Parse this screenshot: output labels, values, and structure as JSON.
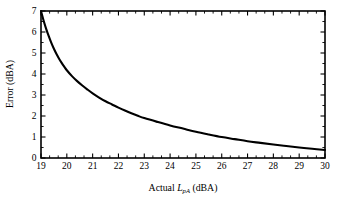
{
  "chart_data": {
    "type": "line",
    "title": "",
    "subtitle": "",
    "xlabel_parts": {
      "lead": "Actual ",
      "symbol": "L",
      "subscript": "pA",
      "trail": " (dBA)"
    },
    "xlabel": "Actual LpA (dBA)",
    "ylabel": "Error (dBA)",
    "xlim": [
      19,
      30
    ],
    "ylim": [
      0,
      7
    ],
    "grid": false,
    "legend": null,
    "x_ticks_major": [
      19,
      20,
      21,
      22,
      23,
      24,
      25,
      26,
      27,
      28,
      29,
      30
    ],
    "x_tick_labels": [
      "19",
      "20",
      "21",
      "22",
      "23",
      "24",
      "25",
      "26",
      "27",
      "28",
      "29",
      "30"
    ],
    "x_minor_per_interval": 2,
    "y_ticks_major": [
      0,
      1,
      2,
      3,
      4,
      5,
      6,
      7
    ],
    "y_tick_labels": [
      "0",
      "1",
      "2",
      "3",
      "4",
      "5",
      "6",
      "7"
    ],
    "y_minor_per_interval": 1,
    "ticks_inward": true,
    "frame": "box-all-sides",
    "series": [
      {
        "name": "Error",
        "color": "#000000",
        "x": [
          19.0,
          19.1,
          19.2,
          19.3,
          19.4,
          19.5,
          19.6,
          19.7,
          19.8,
          19.9,
          20.0,
          20.2,
          20.4,
          20.6,
          20.8,
          21.0,
          21.25,
          21.5,
          21.75,
          22.0,
          22.25,
          22.5,
          22.75,
          23.0,
          23.5,
          24.0,
          24.5,
          25.0,
          25.5,
          26.0,
          26.5,
          27.0,
          27.5,
          28.0,
          28.5,
          29.0,
          29.5,
          30.0
        ],
        "y": [
          7.0,
          6.55,
          6.15,
          5.8,
          5.48,
          5.2,
          4.95,
          4.73,
          4.53,
          4.35,
          4.18,
          3.9,
          3.66,
          3.45,
          3.26,
          3.08,
          2.88,
          2.7,
          2.55,
          2.4,
          2.26,
          2.13,
          2.01,
          1.9,
          1.72,
          1.55,
          1.4,
          1.25,
          1.12,
          1.0,
          0.9,
          0.8,
          0.72,
          0.64,
          0.57,
          0.5,
          0.44,
          0.38
        ]
      }
    ]
  },
  "figure": {
    "background_color": "#ffffff",
    "axis_color": "#000000"
  }
}
